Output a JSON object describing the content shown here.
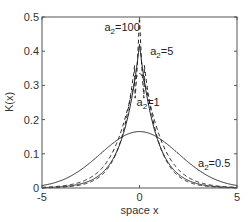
{
  "chart_data": {
    "type": "line",
    "title": "",
    "xlabel": "space x",
    "ylabel": "K(x)",
    "xlim": [
      -5,
      5
    ],
    "ylim": [
      0,
      0.5
    ],
    "xticks": [
      -5,
      0,
      5
    ],
    "xtick_labels": [
      "-5",
      "0",
      "5"
    ],
    "yticks": [
      0,
      0.1,
      0.2,
      0.3,
      0.4,
      0.5
    ],
    "ytick_labels": [
      "0",
      "0.1",
      "0.2",
      "0.3",
      "0.4",
      "0.5"
    ],
    "grid": false,
    "legend": null,
    "series": [
      {
        "name": "a2=100",
        "style": "dashed",
        "peak": 0.5,
        "shape": "sharp",
        "x": [
          -5,
          -3,
          -2,
          -1,
          -0.5,
          -0.2,
          0,
          0.2,
          0.5,
          1,
          2,
          3,
          5
        ],
        "values": [
          0.005,
          0.02,
          0.04,
          0.09,
          0.16,
          0.3,
          0.5,
          0.3,
          0.16,
          0.09,
          0.04,
          0.02,
          0.005
        ]
      },
      {
        "name": "a2=5",
        "style": "solid",
        "peak": 0.42,
        "shape": "cusp",
        "x": [
          -5,
          -3,
          -2,
          -1,
          -0.5,
          0,
          0.5,
          1,
          2,
          3,
          5
        ],
        "values": [
          0.005,
          0.02,
          0.045,
          0.12,
          0.25,
          0.42,
          0.25,
          0.12,
          0.045,
          0.02,
          0.005
        ]
      },
      {
        "name": "a2=1",
        "style": "dashed",
        "peak": 0.335,
        "shape": "rounded",
        "x": [
          -5,
          -3,
          -2,
          -1,
          -0.5,
          0,
          0.5,
          1,
          2,
          3,
          5
        ],
        "values": [
          0.008,
          0.03,
          0.06,
          0.15,
          0.27,
          0.335,
          0.27,
          0.15,
          0.06,
          0.03,
          0.008
        ]
      },
      {
        "name": "a2=0.5",
        "style": "solid",
        "peak": 0.165,
        "shape": "gaussian",
        "x": [
          -5,
          -4,
          -3,
          -2,
          -1,
          0,
          1,
          2,
          3,
          4,
          5
        ],
        "values": [
          0.028,
          0.045,
          0.07,
          0.11,
          0.15,
          0.165,
          0.15,
          0.11,
          0.07,
          0.045,
          0.028
        ]
      }
    ],
    "annotations": [
      {
        "base": "a",
        "sub": "2",
        "rest": "=100",
        "x": -1.8,
        "y": 0.46
      },
      {
        "base": "a",
        "sub": "2",
        "rest": "=5",
        "x": 0.55,
        "y": 0.39
      },
      {
        "base": "a",
        "sub": "2",
        "rest": "=1",
        "x": -0.15,
        "y": 0.24
      },
      {
        "base": "a",
        "sub": "2",
        "rest": "=0.5",
        "x": 3.0,
        "y": 0.06
      }
    ]
  }
}
